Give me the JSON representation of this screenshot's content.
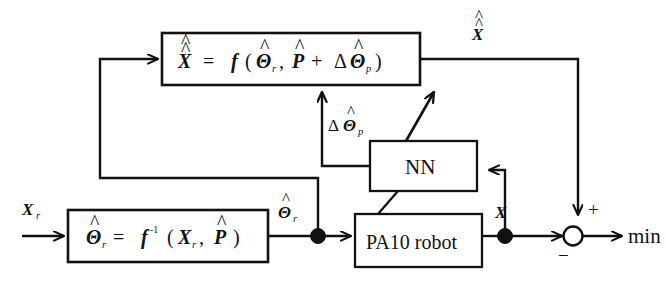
{
  "diagram": {
    "stroke_color": "#111111",
    "background_color": "#ffffff",
    "blocks": [
      {
        "id": "forward-model",
        "name": "forward-kinematics-block",
        "equation_plain": "X^^ = f ( Th^_r , P^ + d Th^_p )",
        "lhs": "X",
        "parts": {
          "f": "f",
          "open": "(",
          "theta_r": "Θ",
          "theta_r_sub": "r",
          "comma": ",",
          "P": "P",
          "plus": "+",
          "delta": "Δ",
          "theta_p": "Θ",
          "theta_p_sub": "p",
          "close": ")",
          "equals": "="
        }
      },
      {
        "id": "inverse-model",
        "name": "inverse-kinematics-block",
        "equation_plain": "Th^_r = f^-1 ( X_r , P^ )",
        "lhs": "Θ",
        "lhs_sub": "r",
        "parts": {
          "f": "f",
          "exp": "-1",
          "open": "(",
          "X_r": "X",
          "X_r_sub": "r",
          "comma": ",",
          "P": "P",
          "close": ")",
          "equals": "="
        }
      },
      {
        "id": "nn",
        "name": "neural-network-block",
        "label": "NN"
      },
      {
        "id": "robot",
        "name": "pa10-robot-block",
        "label": "PA10 robot"
      }
    ],
    "signals": [
      {
        "id": "x-ref",
        "name": "input-signal-xr",
        "label": "X",
        "sub": "r"
      },
      {
        "id": "theta-hat-r",
        "name": "signal-theta-hat-r",
        "label": "Θ",
        "sub": "r"
      },
      {
        "id": "delta-theta-p",
        "name": "signal-delta-theta-hat-p",
        "delta": "Δ",
        "label": "Θ",
        "sub": "p"
      },
      {
        "id": "x-meas",
        "name": "signal-x-measured",
        "label": "X"
      },
      {
        "id": "x-double-hat",
        "name": "signal-x-double-hat",
        "label": "X"
      }
    ],
    "summing_junction": {
      "name": "summing-junction",
      "plus": "+",
      "minus": "−"
    },
    "output": {
      "name": "objective-output-label",
      "label": "min"
    }
  }
}
